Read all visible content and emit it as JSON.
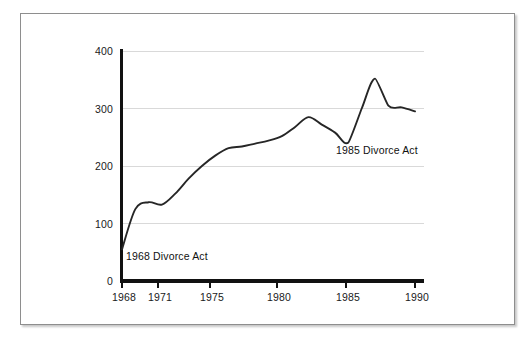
{
  "chart_data": {
    "type": "line",
    "title": "",
    "subtitle": "",
    "xlabel": "",
    "ylabel": "",
    "xlim": [
      1968,
      1990
    ],
    "ylim": [
      0,
      400
    ],
    "grid": true,
    "legend": "none",
    "x_ticks": [
      "1968",
      "1971",
      "1975",
      "1980",
      "1985",
      "1990"
    ],
    "y_ticks": [
      "0",
      "100",
      "200",
      "300",
      "400"
    ],
    "series": [
      {
        "name": "Divorces",
        "x": [
          1968,
          1969,
          1970,
          1971,
          1972,
          1973,
          1974,
          1975,
          1976,
          1977,
          1978,
          1979,
          1980,
          1981,
          1982,
          1983,
          1984,
          1985,
          1986,
          1987,
          1988,
          1989,
          1990
        ],
        "values": [
          55,
          125,
          137,
          133,
          152,
          178,
          200,
          218,
          231,
          234,
          239,
          244,
          252,
          268,
          285,
          272,
          258,
          241,
          300,
          352,
          305,
          302,
          295
        ]
      }
    ],
    "annotations": [
      {
        "name": "annotation-1968",
        "text": "1968 Divorce Act",
        "x": 1968,
        "y": 30
      },
      {
        "name": "annotation-1985",
        "text": "1985 Divorce Act",
        "x": 1985,
        "y": 215
      }
    ]
  },
  "axis": {
    "y_ticks": [
      {
        "label": "400",
        "value": 400
      },
      {
        "label": "300",
        "value": 300
      },
      {
        "label": "200",
        "value": 200
      },
      {
        "label": "100",
        "value": 100
      },
      {
        "label": "0",
        "value": 0
      }
    ],
    "x_ticks": [
      {
        "label": "1968",
        "value": 1968
      },
      {
        "label": "1971",
        "value": 1971
      },
      {
        "label": "1975",
        "value": 1975
      },
      {
        "label": "1980",
        "value": 1980
      },
      {
        "label": "1985",
        "value": 1985
      },
      {
        "label": "1990",
        "value": 1990
      }
    ]
  },
  "annotations": {
    "first": "1968 Divorce Act",
    "second": "1985 Divorce Act"
  },
  "colors": {
    "line": "#262626",
    "axis": "#111111",
    "grid": "#d9d9d9",
    "frame": "#8e8e8e",
    "background": "#ffffff"
  }
}
